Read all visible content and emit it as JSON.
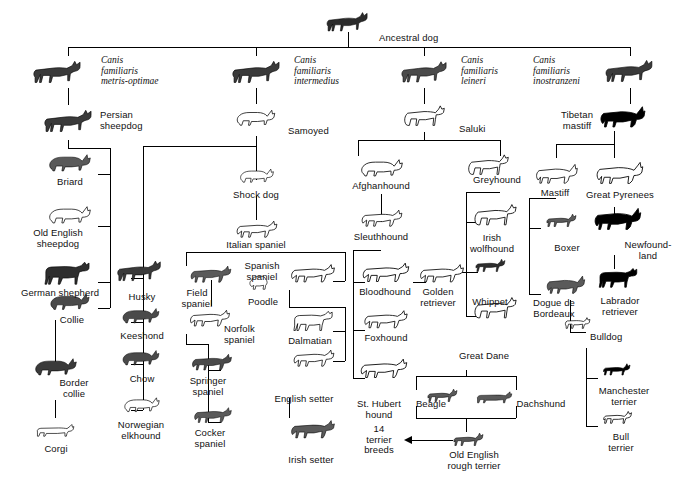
{
  "figure": {
    "type": "phylogenetic-tree",
    "root": {
      "label": "Ancestral dog"
    },
    "species_groups": [
      {
        "id": "metris-optimae",
        "scientific_name": "Canis\nfamiliaris\nmetris-optimae"
      },
      {
        "id": "intermedius",
        "scientific_name": "Canis\nfamiliaris\nintermedius"
      },
      {
        "id": "leineri",
        "scientific_name": "Canis\nfamiliaris\nleineri"
      },
      {
        "id": "inostranzeni",
        "scientific_name": "Canis\nfamiliaris\ninostranzeni"
      }
    ],
    "breeds": {
      "persian_sheepdog": "Persian\nsheepdog",
      "briard": "Briard",
      "old_english_sheepdog": "Old English\nsheepdog",
      "german_shepherd": "German shepherd",
      "collie": "Collie",
      "border_collie": "Border\ncollie",
      "corgi": "Corgi",
      "husky": "Husky",
      "keeshond": "Keeshond",
      "chow": "Chow",
      "norwegian_elkhound": "Norwegian\nelkhound",
      "samoyed": "Samoyed",
      "shock_dog": "Shock dog",
      "italian_spaniel": "Italian spaniel",
      "field_spaniel": "Field\nspaniel",
      "norfolk_spaniel": "Norfolk\nspaniel",
      "springer_spaniel": "Springer\nspaniel",
      "cocker_spaniel": "Cocker\nspaniel",
      "spanish_spaniel": "Spanish\nspaniel",
      "poodle": "Poodle",
      "dalmatian": "Dalmatian",
      "english_setter": "English setter",
      "irish_setter": "Irish setter",
      "saluki": "Saluki",
      "afghanhound": "Afghanhound",
      "sleuthhound": "Sleuthhound",
      "bloodhound": "Bloodhound",
      "golden_retriever": "Golden\nretriever",
      "foxhound": "Foxhound",
      "st_hubert_hound": "St. Hubert\nhound",
      "greyhound": "Greyhound",
      "irish_wolfhound": "Irish\nwolfhound",
      "whippet": "Whippet",
      "great_dane": "Great Dane",
      "beagle": "Beagle",
      "dachshund": "Dachshund",
      "old_english_rough_terrier": "Old English\nrough terrier",
      "terrier_breeds": "14\nterrier\nbreeds",
      "tibetan_mastiff": "Tibetan\nmastiff",
      "mastiff": "Mastiff",
      "great_pyrenees": "Great Pyrenees",
      "boxer": "Boxer",
      "newfoundland": "Newfound-\nland",
      "dogue_de_bordeaux": "Dogue de\nBordeaux",
      "labrador_retriever": "Labrador\nretriever",
      "bulldog": "Bulldog",
      "manchester_terrier": "Manchester\nterrier",
      "bull_terrier": "Bull\nterrier"
    },
    "colors": {
      "line": "#000000",
      "text": "#111111",
      "background": "#ffffff"
    }
  }
}
